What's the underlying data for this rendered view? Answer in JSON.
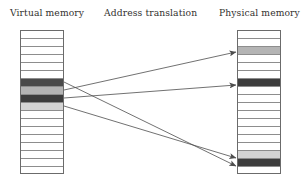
{
  "diagram": {
    "title_labels": {
      "virtual": "Virtual memory",
      "translation": "Address translation",
      "physical": "Physical memory"
    },
    "colors": {
      "empty_cell": "#ffffff",
      "cell_border": "#8d8d8d",
      "block_border": "#6b6b6b",
      "shade_dark": "#4a4a4a",
      "shade_darker": "#3d3d3d",
      "shade_medium": "#b4b4b4",
      "shade_light": "#d4d4d4",
      "shade_lighter": "#dedede",
      "arrow": "#4d4d4d",
      "text": "#33312f",
      "background": "#ffffff"
    },
    "virtual_memory": {
      "name": "Virtual memory",
      "row_count": 18,
      "rows": [
        {
          "index": 0,
          "shade": "empty"
        },
        {
          "index": 1,
          "shade": "empty"
        },
        {
          "index": 2,
          "shade": "empty"
        },
        {
          "index": 3,
          "shade": "empty"
        },
        {
          "index": 4,
          "shade": "empty"
        },
        {
          "index": 5,
          "shade": "empty"
        },
        {
          "index": 6,
          "shade": "dark"
        },
        {
          "index": 7,
          "shade": "medium"
        },
        {
          "index": 8,
          "shade": "darker"
        },
        {
          "index": 9,
          "shade": "light"
        },
        {
          "index": 10,
          "shade": "empty"
        },
        {
          "index": 11,
          "shade": "empty"
        },
        {
          "index": 12,
          "shade": "empty"
        },
        {
          "index": 13,
          "shade": "empty"
        },
        {
          "index": 14,
          "shade": "empty"
        },
        {
          "index": 15,
          "shade": "empty"
        },
        {
          "index": 16,
          "shade": "empty"
        },
        {
          "index": 17,
          "shade": "empty"
        }
      ]
    },
    "physical_memory": {
      "name": "Physical memory",
      "row_count": 18,
      "rows": [
        {
          "index": 0,
          "shade": "empty"
        },
        {
          "index": 1,
          "shade": "empty"
        },
        {
          "index": 2,
          "shade": "medium"
        },
        {
          "index": 3,
          "shade": "empty"
        },
        {
          "index": 4,
          "shade": "empty"
        },
        {
          "index": 5,
          "shade": "empty"
        },
        {
          "index": 6,
          "shade": "darker"
        },
        {
          "index": 7,
          "shade": "empty"
        },
        {
          "index": 8,
          "shade": "empty"
        },
        {
          "index": 9,
          "shade": "empty"
        },
        {
          "index": 10,
          "shade": "empty"
        },
        {
          "index": 11,
          "shade": "empty"
        },
        {
          "index": 12,
          "shade": "empty"
        },
        {
          "index": 13,
          "shade": "empty"
        },
        {
          "index": 14,
          "shade": "empty"
        },
        {
          "index": 15,
          "shade": "light"
        },
        {
          "index": 16,
          "shade": "darker"
        },
        {
          "index": 17,
          "shade": "empty"
        }
      ]
    },
    "mappings": [
      {
        "id": "map-1",
        "from_row": 6,
        "to_row": 16,
        "from_x": 64,
        "from_y": 82,
        "to_x": 236,
        "to_y": 166
      },
      {
        "id": "map-2",
        "from_row": 7,
        "to_row": 2,
        "from_x": 64,
        "from_y": 90,
        "to_x": 236,
        "to_y": 52
      },
      {
        "id": "map-3",
        "from_row": 8,
        "to_row": 6,
        "from_x": 64,
        "from_y": 98,
        "to_x": 236,
        "to_y": 85
      },
      {
        "id": "map-4",
        "from_row": 9,
        "to_row": 15,
        "from_x": 64,
        "from_y": 106,
        "to_x": 236,
        "to_y": 158
      }
    ]
  }
}
